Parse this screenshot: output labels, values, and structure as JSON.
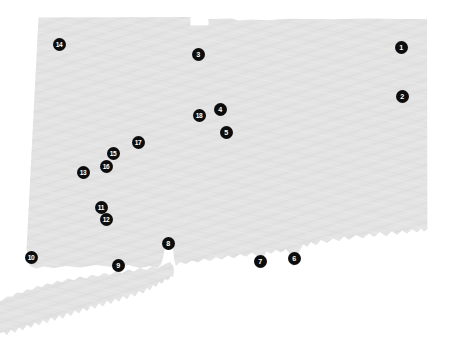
{
  "map": {
    "title": "Connecticut numbered location map",
    "region_name": "Connecticut",
    "land_color": "#e2e2e2",
    "background_color": "#ffffff",
    "marker_fill_color": "#0d0d0d",
    "marker_label_color": "#ffffff",
    "marker_diameter_px": 13,
    "width_px": 452,
    "height_px": 354
  },
  "markers": [
    {
      "label": "1",
      "x": 401,
      "y": 47,
      "name": "marker-1"
    },
    {
      "label": "2",
      "x": 402,
      "y": 96,
      "name": "marker-2"
    },
    {
      "label": "3",
      "x": 198,
      "y": 54,
      "name": "marker-3"
    },
    {
      "label": "4",
      "x": 220,
      "y": 109,
      "name": "marker-4"
    },
    {
      "label": "5",
      "x": 226,
      "y": 132,
      "name": "marker-5"
    },
    {
      "label": "6",
      "x": 294,
      "y": 258,
      "name": "marker-6"
    },
    {
      "label": "7",
      "x": 260,
      "y": 261,
      "name": "marker-7"
    },
    {
      "label": "8",
      "x": 168,
      "y": 243,
      "name": "marker-8"
    },
    {
      "label": "9",
      "x": 118,
      "y": 265,
      "name": "marker-9"
    },
    {
      "label": "10",
      "x": 31,
      "y": 257,
      "name": "marker-10"
    },
    {
      "label": "11",
      "x": 101,
      "y": 207,
      "name": "marker-11"
    },
    {
      "label": "12",
      "x": 106,
      "y": 219,
      "name": "marker-12"
    },
    {
      "label": "13",
      "x": 83,
      "y": 172,
      "name": "marker-13"
    },
    {
      "label": "14",
      "x": 59,
      "y": 44,
      "name": "marker-14"
    },
    {
      "label": "15",
      "x": 113,
      "y": 153,
      "name": "marker-15"
    },
    {
      "label": "16",
      "x": 106,
      "y": 166,
      "name": "marker-16"
    },
    {
      "label": "17",
      "x": 138,
      "y": 142,
      "name": "marker-17"
    },
    {
      "label": "18",
      "x": 199,
      "y": 115,
      "name": "marker-18"
    }
  ]
}
